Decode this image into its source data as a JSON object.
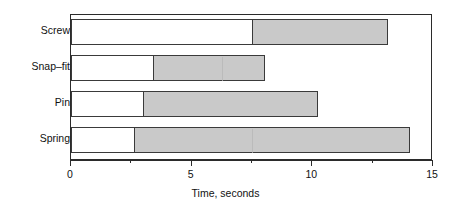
{
  "chart_data": {
    "type": "bar",
    "orientation": "horizontal",
    "stacked": true,
    "title": "",
    "xlabel": "Time, seconds",
    "ylabel": "",
    "xlim": [
      0,
      15
    ],
    "xticks": [
      0,
      5,
      10,
      15
    ],
    "xtick_labels": [
      "0",
      "5",
      "10",
      "15"
    ],
    "xminor_ticks": [
      2.5,
      7.5,
      12.5
    ],
    "grid": false,
    "legend": null,
    "categories": [
      "Screw",
      "Snap–fit",
      "Pin",
      "Spring"
    ],
    "series": [
      {
        "name": "segment-1",
        "fill": "white",
        "values": [
          7.5,
          3.4,
          3.0,
          2.6
        ]
      },
      {
        "name": "segment-2",
        "fill": "gray",
        "values": [
          5.6,
          4.6,
          7.2,
          11.4
        ]
      }
    ],
    "totals": [
      13.1,
      8.0,
      10.2,
      14.0
    ],
    "bars": [
      {
        "category": "Screw",
        "start": 0,
        "split": 7.5,
        "end": 13.1
      },
      {
        "category": "Snap–fit",
        "start": 0,
        "split": 3.4,
        "end": 8.0
      },
      {
        "category": "Pin",
        "start": 0,
        "split": 3.0,
        "end": 10.2
      },
      {
        "category": "Spring",
        "start": 0,
        "split": 2.6,
        "end": 14.0
      }
    ]
  },
  "axis": {
    "x_title": "Time, seconds",
    "tick_0": "0",
    "tick_1": "5",
    "tick_2": "10",
    "tick_3": "15"
  },
  "labels": {
    "screw": "Screw",
    "snapfit": "Snap–fit",
    "pin": "Pin",
    "spring": "Spring"
  },
  "colors": {
    "bar_fill": "#c9c9c9",
    "bar_empty": "#ffffff",
    "bar_border": "#3a3a3a",
    "frame": "#2b2b2b",
    "text": "#111111",
    "background": "#ffffff"
  }
}
